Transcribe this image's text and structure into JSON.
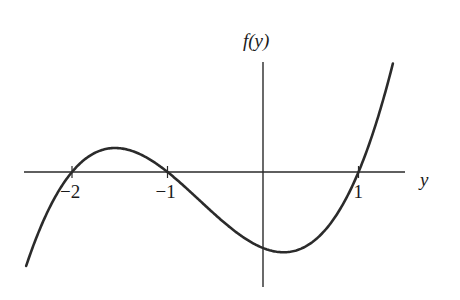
{
  "chart_data": {
    "type": "line",
    "title": "",
    "xlabel": "y",
    "ylabel": "f(y)",
    "function": "f(y) = (y + 2)(y + 1)(y - 1)",
    "roots": [
      -2,
      -1,
      1
    ],
    "xlim": [
      -2.5,
      1.4
    ],
    "ylim": [
      -2.6,
      2.4
    ],
    "ticks": [
      {
        "value": -2,
        "label": "−2"
      },
      {
        "value": -1,
        "label": "−1"
      },
      {
        "value": 1,
        "label": "1"
      }
    ],
    "grid": false,
    "legend": "none"
  }
}
